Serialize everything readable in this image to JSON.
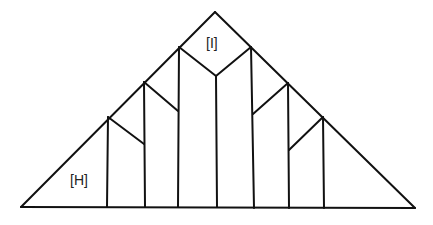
{
  "diagram": {
    "type": "truss-triangle",
    "stroke_color": "#111111",
    "labels": [
      {
        "id": "H",
        "text": "[H]",
        "x": 70,
        "y": 185
      },
      {
        "id": "I",
        "text": "[I]",
        "x": 206,
        "y": 48
      }
    ],
    "outline": {
      "apex": [
        215,
        12
      ],
      "left_base": [
        21,
        207
      ],
      "right_base": [
        415,
        208
      ]
    },
    "verticals": [
      {
        "top": [
          108,
          117
        ],
        "bottom": [
          107,
          207
        ]
      },
      {
        "top": [
          144,
          82
        ],
        "bottom": [
          145,
          207
        ]
      },
      {
        "top": [
          179,
          47
        ],
        "bottom": [
          178,
          207
        ]
      },
      {
        "top": [
          216,
          76
        ],
        "bottom": [
          217,
          207
        ]
      },
      {
        "top": [
          251,
          47
        ],
        "bottom": [
          254,
          208
        ]
      },
      {
        "top": [
          288,
          83
        ],
        "bottom": [
          289,
          208
        ]
      },
      {
        "top": [
          323,
          117
        ],
        "bottom": [
          324,
          208
        ]
      }
    ],
    "diagonals": [
      {
        "from": [
          108,
          117
        ],
        "to": [
          144,
          144
        ]
      },
      {
        "from": [
          144,
          82
        ],
        "to": [
          178,
          111
        ]
      },
      {
        "from": [
          179,
          47
        ],
        "to": [
          216,
          76
        ]
      },
      {
        "from": [
          216,
          76
        ],
        "to": [
          251,
          47
        ]
      },
      {
        "from": [
          253,
          114
        ],
        "to": [
          288,
          83
        ]
      },
      {
        "from": [
          289,
          150
        ],
        "to": [
          323,
          117
        ]
      }
    ]
  }
}
